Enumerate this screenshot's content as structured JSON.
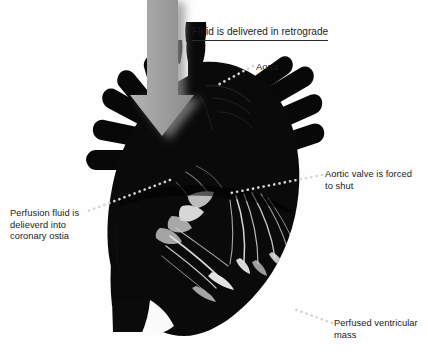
{
  "figure": {
    "title": "Fluid is delivered in retrograde",
    "background_color": "#fefefe",
    "heart_color": "#070707",
    "arrow_color": "#9a9a9a",
    "leader_color": "#d2d2d2",
    "text_color": "#1b1b1b"
  },
  "labels": {
    "aorta": "Aorta",
    "aortic_valve": "Aortic valve is forced\nto shut",
    "coronary_ostia": "Perfusion fluid is\ndelieverd into\ncoronary ostia",
    "ventricular_mass": "Perfused ventricular\nmass"
  },
  "annotations": {
    "arrow_name": "retrograde-flow-arrow",
    "leader_aorta": "aorta-leader-line",
    "leader_valve": "aortic-valve-leader-line",
    "leader_ostia": "coronary-ostia-leader-line",
    "leader_mass": "ventricular-mass-leader-line"
  }
}
